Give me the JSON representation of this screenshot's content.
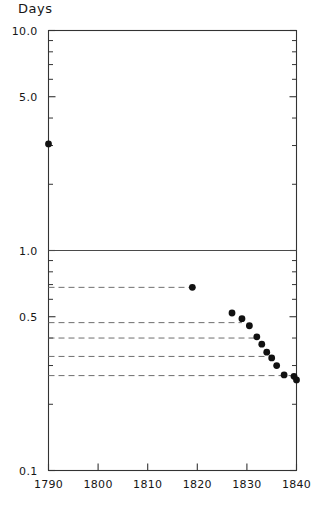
{
  "chart_data": {
    "type": "scatter",
    "title": "Days",
    "xlabel": "",
    "ylabel": "Days",
    "yscale": "log",
    "ylim": [
      0.1,
      10.0
    ],
    "xlim": [
      1790,
      1840
    ],
    "grid": false,
    "legend": null,
    "y_tick_labels": [
      "10.0",
      "5.0",
      "1.0",
      "0.5",
      "0.1"
    ],
    "y_tick_values": [
      10.0,
      5.0,
      1.0,
      0.5,
      0.1
    ],
    "y_minor_ticks": [
      9.0,
      8.0,
      7.0,
      6.0,
      4.0,
      3.0,
      2.0,
      0.9,
      0.8,
      0.7,
      0.6,
      0.4,
      0.3,
      0.2
    ],
    "x_tick_labels": [
      "1790",
      "1800",
      "1810",
      "1820",
      "1830",
      "1840"
    ],
    "x_tick_values": [
      1790,
      1800,
      1810,
      1820,
      1830,
      1840
    ],
    "reference_lines": [
      {
        "y": 1.0,
        "style": "solid",
        "x_from": 1790,
        "x_to": 1840
      }
    ],
    "dashed_reference_lines": [
      {
        "y": 0.68,
        "style": "dashed",
        "x_from": 1790,
        "x_to": 1819
      },
      {
        "y": 0.47,
        "style": "dashed",
        "x_from": 1790,
        "x_to": 1829
      },
      {
        "y": 0.4,
        "style": "dashed",
        "x_from": 1790,
        "x_to": 1832
      },
      {
        "y": 0.33,
        "style": "dashed",
        "x_from": 1790,
        "x_to": 1834
      },
      {
        "y": 0.27,
        "style": "dashed",
        "x_from": 1790,
        "x_to": 1840
      }
    ],
    "series": [
      {
        "name": "Travel time",
        "marker": "filled-circle",
        "color": "#111111",
        "points": [
          {
            "x": 1790,
            "y": 3.05
          },
          {
            "x": 1819,
            "y": 0.68
          },
          {
            "x": 1827,
            "y": 0.52
          },
          {
            "x": 1829,
            "y": 0.49
          },
          {
            "x": 1830.5,
            "y": 0.455
          },
          {
            "x": 1832,
            "y": 0.405
          },
          {
            "x": 1833,
            "y": 0.375
          },
          {
            "x": 1834,
            "y": 0.345
          },
          {
            "x": 1835,
            "y": 0.325
          },
          {
            "x": 1836,
            "y": 0.3
          },
          {
            "x": 1837.5,
            "y": 0.272
          },
          {
            "x": 1839.5,
            "y": 0.268
          },
          {
            "x": 1840,
            "y": 0.258
          }
        ]
      }
    ]
  },
  "caption": ""
}
